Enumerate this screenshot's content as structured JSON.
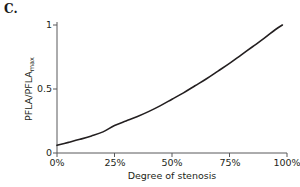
{
  "figure": {
    "panel_label": "C.",
    "background_color": "#ffffff",
    "axis_color": "#58595b",
    "curve_color": "#231f20",
    "text_color": "#231f20"
  },
  "chart_data": {
    "type": "line",
    "title": "",
    "subtitle": "",
    "panel": "C.",
    "xlabel": "Degree of stenosis",
    "ylabel": "PFLA/PFLA_max",
    "ylabel_base": "PFLA/PFLA",
    "ylabel_subscript": "max",
    "xlim": [
      0,
      100
    ],
    "ylim": [
      0,
      1.06
    ],
    "xticks": [
      0,
      25,
      50,
      75,
      100
    ],
    "xtick_labels": [
      "0%",
      "25%",
      "50%",
      "75%",
      "100%"
    ],
    "yticks": [
      0,
      0.5,
      1
    ],
    "ytick_labels": [
      "0",
      "0.5",
      "1"
    ],
    "grid": false,
    "legend": false,
    "legend_position": "none",
    "series": [
      {
        "name": "PFLA ratio vs stenosis",
        "x": [
          0,
          5,
          10,
          15,
          20,
          25,
          30,
          35,
          40,
          45,
          50,
          55,
          60,
          65,
          70,
          75,
          80,
          85,
          90,
          95,
          98
        ],
        "values": [
          0.06,
          0.083,
          0.107,
          0.133,
          0.165,
          0.215,
          0.25,
          0.285,
          0.325,
          0.37,
          0.42,
          0.47,
          0.525,
          0.58,
          0.64,
          0.7,
          0.765,
          0.83,
          0.895,
          0.965,
          1.0
        ]
      }
    ],
    "annotations": []
  }
}
